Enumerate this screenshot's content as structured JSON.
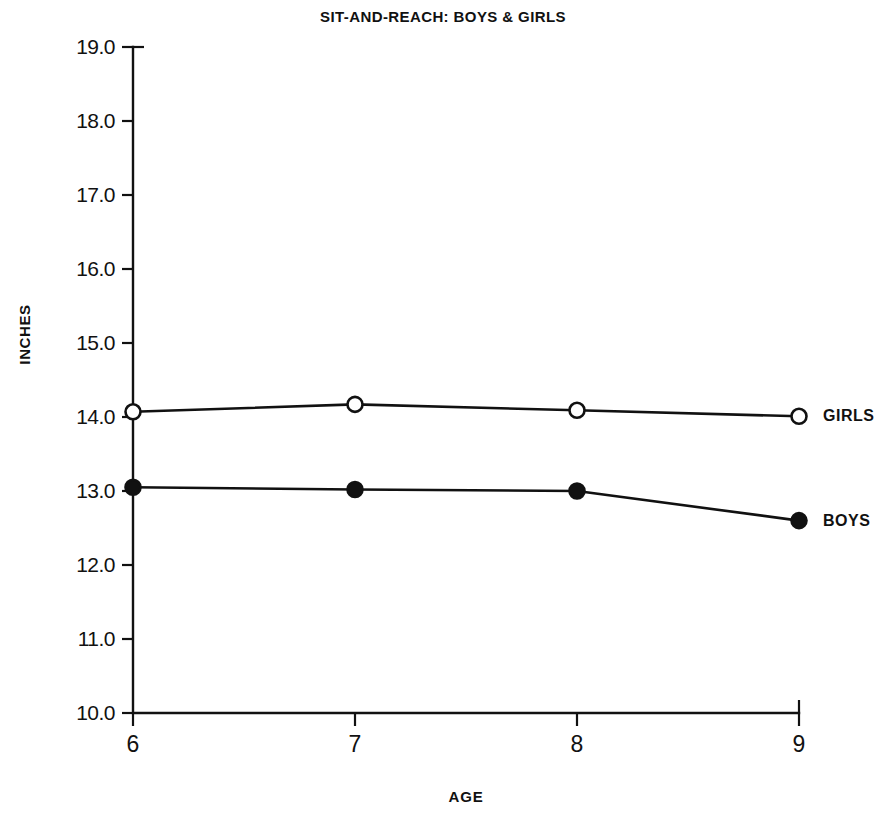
{
  "chart_data": {
    "type": "line",
    "title": "SIT-AND-REACH: BOYS & GIRLS",
    "xlabel": "AGE",
    "ylabel": "INCHES",
    "x": [
      6,
      7,
      8,
      9
    ],
    "xticklabels": [
      "6",
      "7",
      "8",
      "9"
    ],
    "xlim": [
      6,
      9
    ],
    "ylim": [
      10.0,
      19.0
    ],
    "yticks": [
      10.0,
      11.0,
      12.0,
      13.0,
      14.0,
      15.0,
      16.0,
      17.0,
      18.0,
      19.0
    ],
    "yticklabels": [
      "10.0",
      "11.0",
      "12.0",
      "13.0",
      "14.0",
      "15.0",
      "16.0",
      "17.0",
      "18.0",
      "19.0"
    ],
    "grid": false,
    "legend_position": "inline-right",
    "series": [
      {
        "name": "GIRLS",
        "label": "GIRLS",
        "marker": "open-circle",
        "color": "#111111",
        "values": [
          14.07,
          14.17,
          14.09,
          14.01
        ]
      },
      {
        "name": "BOYS",
        "label": "BOYS",
        "marker": "filled-circle",
        "color": "#111111",
        "values": [
          13.05,
          13.02,
          13.0,
          12.6
        ]
      }
    ]
  },
  "figure": {
    "background": "#ffffff",
    "foreground": "#111111"
  }
}
